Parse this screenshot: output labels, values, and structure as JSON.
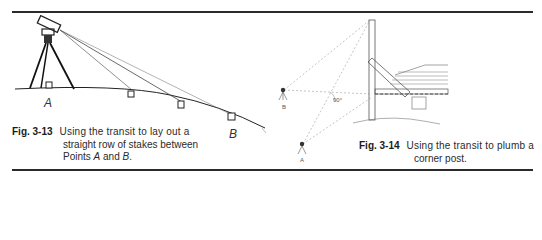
{
  "figures": [
    {
      "number": "Fig. 3-13",
      "caption_lines": [
        "Using the transit to lay out a",
        "straight row of stakes between",
        "Points "
      ],
      "caption_point_a": "A",
      "caption_and": " and ",
      "caption_point_b": "B",
      "caption_end": ".",
      "labels": {
        "point_a": "A",
        "point_b": "B"
      }
    },
    {
      "number": "Fig. 3-14",
      "caption_lines": [
        "Using the transit to plumb a",
        "corner post."
      ],
      "labels": {
        "station_a": "A",
        "station_b": "B",
        "angle": "90°"
      }
    }
  ]
}
